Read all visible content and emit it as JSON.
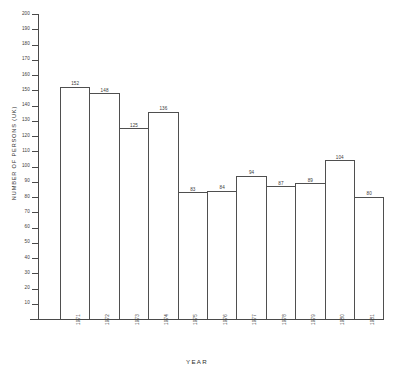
{
  "chart_data": {
    "type": "bar",
    "title": "",
    "subtitle": "",
    "xlabel": "YEAR",
    "ylabel": "NUMBER OF PERSONS  (UK)",
    "categories": [
      "1971",
      "1972",
      "1973",
      "1974",
      "1975",
      "1976",
      "1977",
      "1978",
      "1979",
      "1980",
      "1981"
    ],
    "values": [
      152,
      148,
      125,
      136,
      83,
      84,
      94,
      87,
      89,
      104,
      80
    ],
    "ylim": [
      0,
      200
    ],
    "ytick_step": 10,
    "yticks": [
      10,
      20,
      30,
      40,
      50,
      60,
      70,
      80,
      90,
      100,
      110,
      120,
      130,
      140,
      150,
      160,
      170,
      180,
      190,
      200
    ],
    "ytick_labels": [
      "10",
      "20",
      "30",
      "40",
      "50",
      "60",
      "70",
      "80",
      "90",
      "100",
      "110",
      "120",
      "130",
      "140",
      "150",
      "160",
      "170",
      "180",
      "190",
      "200"
    ],
    "grid": false,
    "legend": null,
    "legend_position": "none",
    "bar_style": {
      "fill": "#ffffff",
      "edge": "#4f4f4f",
      "gap": 0
    },
    "value_labels_shown": true,
    "annotations": []
  },
  "colors": {
    "axis": "#4a4a4a",
    "bar_edge": "#4f4f4f",
    "bar_fill": "#ffffff",
    "text": "#3a3a3a",
    "background": "#ffffff"
  }
}
